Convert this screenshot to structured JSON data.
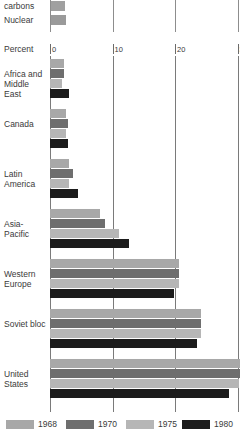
{
  "chart_data": {
    "type": "bar",
    "orientation": "horizontal",
    "title": "",
    "xlabel": "Percent",
    "ylabel": "",
    "xlim": [
      0,
      33
    ],
    "grid": true,
    "grid_axis": "x",
    "xticks": [
      0,
      10,
      20,
      30
    ],
    "xtick_labels": [
      "0",
      "10",
      "20",
      "30"
    ],
    "categories": [
      "Africa and Middle East",
      "Canada",
      "Latin America",
      "Asia-Pacific",
      "Western Europe",
      "Soviet bloc",
      "United States"
    ],
    "legend_position": "bottom",
    "series": [
      {
        "name": "1968",
        "color": "#a8a8a8",
        "values": [
          2.2,
          2.6,
          3.1,
          8.0,
          20.6,
          24.2,
          31.9
        ]
      },
      {
        "name": "1970",
        "color": "#6e6e6e",
        "values": [
          2.3,
          2.8,
          3.6,
          8.8,
          20.6,
          24.2,
          31.9
        ]
      },
      {
        "name": "1975",
        "color": "#b6b6b6",
        "values": [
          1.9,
          2.5,
          3.0,
          11.0,
          20.6,
          24.2,
          30.2
        ]
      },
      {
        "name": "1980",
        "color": "#1c1c1c",
        "values": [
          3.1,
          2.9,
          4.4,
          12.6,
          19.8,
          23.5,
          28.6
        ]
      }
    ]
  },
  "top_fragment": {
    "note": "truncated chart from preceding figure",
    "rows": [
      {
        "label": "carbons",
        "value": 2.4,
        "color": "#a0a0a0"
      },
      {
        "label": "Nuclear",
        "value": 2.6,
        "color": "#9a9a9a"
      }
    ],
    "gridlines": [
      0,
      10,
      20,
      30
    ]
  },
  "legend": {
    "items": [
      {
        "label": "1968",
        "color": "#a8a8a8"
      },
      {
        "label": "1970",
        "color": "#6e6e6e"
      },
      {
        "label": "1975",
        "color": "#b6b6b6"
      },
      {
        "label": "1980",
        "color": "#1c1c1c"
      }
    ]
  },
  "colors": {
    "background": "#ffffff",
    "text": "#3a3a3a",
    "gridline": "#7a7a7a"
  }
}
